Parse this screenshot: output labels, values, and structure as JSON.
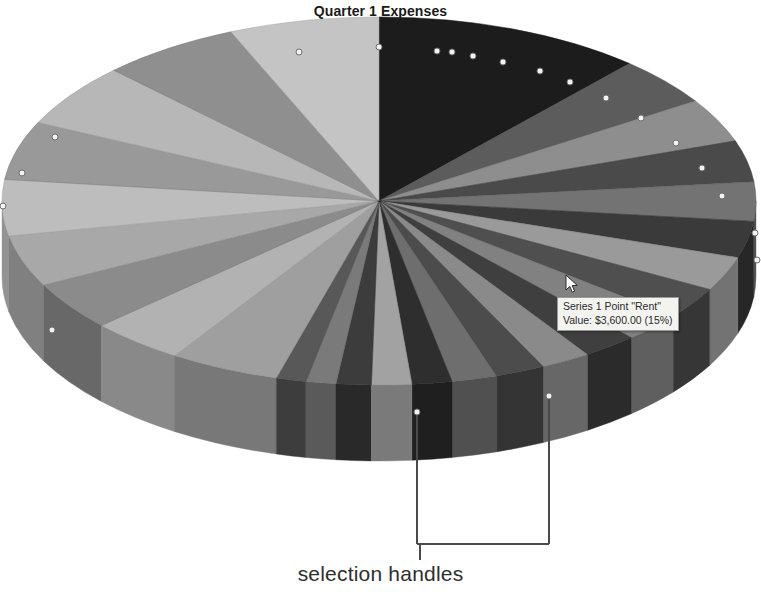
{
  "chart_title": "Quarter 1 Expenses",
  "tooltip": {
    "line1": "Series 1 Point \"Rent\"",
    "line2": "Value:  $3,600.00  (15%)",
    "series_name": "Series 1",
    "point_name": "Rent",
    "value_text": "$3,600.00",
    "percent_text": "(15%)"
  },
  "annotation": {
    "label": "selection handles"
  },
  "cursor": {
    "name": "mouse-pointer",
    "x": 568,
    "y": 277
  },
  "chart_data": {
    "type": "pie",
    "title": "Quarter 1 Expenses",
    "subtitle": "",
    "xlabel": "",
    "ylabel": "",
    "legend_position": "none",
    "grid": false,
    "three_d": true,
    "series_name": "Series 1",
    "value_prefix": "$",
    "selected_slice": "Rent",
    "selected_value": 3600,
    "selected_percent": 15,
    "total": 24000,
    "geometry": {
      "center_x": 379,
      "center_y": 201,
      "radius_x": 377,
      "radius_y": 184,
      "depth": 76,
      "start_angle_deg": -90
    },
    "categories": [
      "Rent",
      "Payroll",
      "Utilities",
      "Insurance",
      "Supplies",
      "Marketing",
      "Travel",
      "Equipment",
      "Software",
      "Legal",
      "Training",
      "Shipping",
      "Repairs",
      "Taxes",
      "Telecom",
      "Fuel",
      "Dues",
      "Misc"
    ],
    "values": [
      3600,
      2520,
      2160,
      1920,
      1800,
      1680,
      1560,
      1440,
      1320,
      1200,
      1080,
      960,
      840,
      720,
      600,
      480,
      360,
      240
    ],
    "percents": [
      15,
      10.5,
      9,
      8,
      7.5,
      7,
      6.5,
      6,
      5.5,
      5,
      4.5,
      4,
      3.5,
      3,
      2.5,
      2,
      1.5,
      1
    ],
    "slices": [
      {
        "label": "Rent",
        "value": 3600,
        "percent": 15,
        "sweep_deg": 54,
        "top_color": "#1c1c1c",
        "side_color": "#0d0d0d"
      },
      {
        "label": "Payroll",
        "value": 2520,
        "percent": 10.5,
        "sweep_deg": 20,
        "top_color": "#5c5c5c",
        "side_color": "#3e3e3e"
      },
      {
        "label": "Utilities",
        "value": 2160,
        "percent": 9,
        "sweep_deg": 18,
        "top_color": "#8e8e8e",
        "side_color": "#6a6a6a"
      },
      {
        "label": "Insurance",
        "value": 1920,
        "percent": 8,
        "sweep_deg": 17,
        "top_color": "#4a4a4a",
        "side_color": "#323232"
      },
      {
        "label": "Supplies",
        "value": 1800,
        "percent": 7.5,
        "sweep_deg": 16,
        "top_color": "#737373",
        "side_color": "#545454"
      },
      {
        "label": "Marketing",
        "value": 1680,
        "percent": 7,
        "sweep_deg": 15,
        "top_color": "#3a3a3a",
        "side_color": "#272727"
      },
      {
        "label": "Travel",
        "value": 1560,
        "percent": 6.5,
        "sweep_deg": 14,
        "top_color": "#9a9a9a",
        "side_color": "#737373"
      },
      {
        "label": "Equipment",
        "value": 1440,
        "percent": 6,
        "sweep_deg": 13,
        "top_color": "#4f4f4f",
        "side_color": "#363636"
      },
      {
        "label": "Software",
        "value": 1320,
        "percent": 5.5,
        "sweep_deg": 12,
        "top_color": "#818181",
        "side_color": "#5f5f5f"
      },
      {
        "label": "Legal",
        "value": 1200,
        "percent": 5,
        "sweep_deg": 11,
        "top_color": "#3f3f3f",
        "side_color": "#2b2b2b"
      },
      {
        "label": "Training",
        "value": 1080,
        "percent": 4.5,
        "sweep_deg": 10,
        "top_color": "#8a8a8a",
        "side_color": "#676767"
      },
      {
        "label": "Shipping",
        "value": 960,
        "percent": 4,
        "sweep_deg": 10,
        "top_color": "#4c4c4c",
        "side_color": "#343434"
      },
      {
        "label": "Repairs",
        "value": 840,
        "percent": 3.5,
        "sweep_deg": 9,
        "top_color": "#6e6e6e",
        "side_color": "#505050"
      },
      {
        "label": "Taxes",
        "value": 720,
        "percent": 3,
        "sweep_deg": 8,
        "top_color": "#2e2e2e",
        "side_color": "#1f1f1f"
      },
      {
        "label": "Telecom",
        "value": 600,
        "percent": 2.5,
        "sweep_deg": 8,
        "top_color": "#a2a2a2",
        "side_color": "#7a7a7a"
      },
      {
        "label": "Fuel",
        "value": 480,
        "percent": 2,
        "sweep_deg": 7,
        "top_color": "#3c3c3c",
        "side_color": "#292929"
      },
      {
        "label": "Dues",
        "value": 360,
        "percent": 1.5,
        "sweep_deg": 6,
        "top_color": "#7a7a7a",
        "side_color": "#5a5a5a"
      },
      {
        "label": "Misc",
        "value": 240,
        "percent": 1,
        "sweep_deg": 6,
        "top_color": "#585858",
        "side_color": "#3d3d3d"
      }
    ],
    "left_slices": [
      {
        "label": "L1",
        "sweep_deg": 22,
        "top_color": "#9f9f9f",
        "side_color": "#787878"
      },
      {
        "label": "L2",
        "sweep_deg": 19,
        "top_color": "#b2b2b2",
        "side_color": "#898989"
      },
      {
        "label": "L3",
        "sweep_deg": 20,
        "top_color": "#8b8b8b",
        "side_color": "#686868"
      },
      {
        "label": "L4",
        "sweep_deg": 21,
        "top_color": "#a8a8a8",
        "side_color": "#808080"
      },
      {
        "label": "L5",
        "sweep_deg": 23,
        "top_color": "#bdbdbd",
        "side_color": "#939393"
      },
      {
        "label": "L6",
        "sweep_deg": 24,
        "top_color": "#999999",
        "side_color": "#747474"
      },
      {
        "label": "L7",
        "sweep_deg": 26,
        "top_color": "#b7b7b7",
        "side_color": "#8e8e8e"
      },
      {
        "label": "L8",
        "sweep_deg": 28,
        "top_color": "#8f8f8f",
        "side_color": "#6c6c6c"
      },
      {
        "label": "L9",
        "sweep_deg": 30,
        "top_color": "#c4c4c4",
        "side_color": "#9a9a9a"
      }
    ]
  },
  "handles": {
    "name": "selection-handle",
    "fill": "#f2f2f2",
    "stroke": "#6e6e6e",
    "radius": 3,
    "points": [
      [
        379,
        47
      ],
      [
        299,
        52
      ],
      [
        437,
        51
      ],
      [
        452,
        52
      ],
      [
        473,
        56
      ],
      [
        503,
        62
      ],
      [
        540,
        71
      ],
      [
        570,
        82
      ],
      [
        606,
        98
      ],
      [
        641,
        118
      ],
      [
        676,
        143
      ],
      [
        702,
        168
      ],
      [
        722,
        196
      ],
      [
        755,
        233
      ],
      [
        757,
        260
      ],
      [
        55,
        137
      ],
      [
        22,
        173
      ],
      [
        3,
        206
      ],
      [
        52,
        330
      ],
      [
        417,
        412
      ],
      [
        549,
        396
      ]
    ]
  },
  "leader": {
    "name": "selection-handle-callout",
    "stroke": "#4a4a4a",
    "left_x": 417,
    "right_x": 549,
    "left_top_y": 412,
    "right_top_y": 396,
    "bar_y": 544,
    "stem_x": 420,
    "stem_bottom_y": 560
  }
}
